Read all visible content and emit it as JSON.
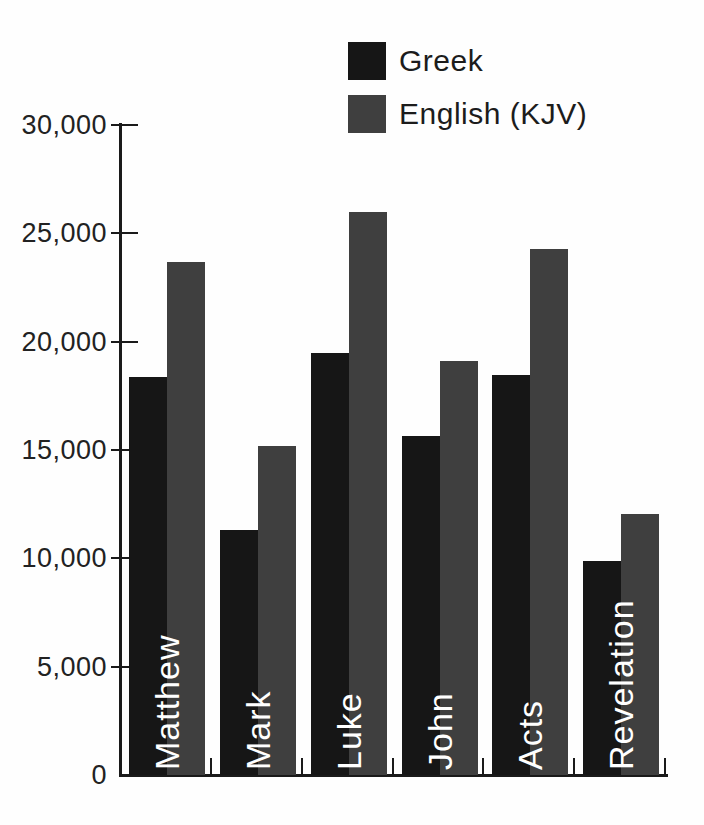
{
  "chart_data": {
    "type": "bar",
    "title": "",
    "xlabel": "",
    "ylabel": "",
    "grid": false,
    "legend_position": "top-center",
    "background": "#fefefe",
    "axis_color": "#1a1a1a",
    "bar_label_color": "#ffffff",
    "categories": [
      "Matthew",
      "Mark",
      "Luke",
      "John",
      "Acts",
      "Revelation"
    ],
    "series": [
      {
        "name": "Greek",
        "color": "#161616",
        "values": [
          18350,
          11300,
          19500,
          15650,
          18450,
          9900
        ]
      },
      {
        "name": "English (KJV)",
        "color": "#3f3f3f",
        "values": [
          23700,
          15200,
          26000,
          19100,
          24300,
          12050
        ]
      }
    ],
    "ylim": [
      0,
      30000
    ],
    "ytick_step": 5000,
    "yticks": [
      {
        "value": 0,
        "label": "0"
      },
      {
        "value": 5000,
        "label": "5,000"
      },
      {
        "value": 10000,
        "label": "10,000"
      },
      {
        "value": 15000,
        "label": "15,000"
      },
      {
        "value": 20000,
        "label": "20,000"
      },
      {
        "value": 25000,
        "label": "25,000"
      },
      {
        "value": 30000,
        "label": "30,000"
      }
    ]
  }
}
